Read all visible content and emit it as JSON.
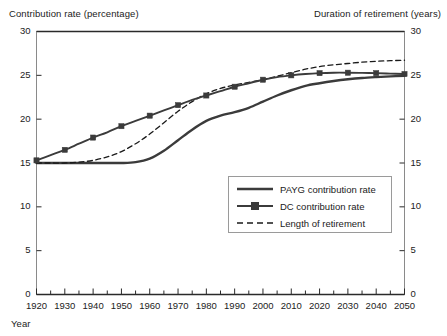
{
  "chart_data": {
    "type": "line",
    "title": "",
    "xlabel": "Year",
    "ylabel": "Contribution rate (percentage)",
    "y2label": "Duration of retirement (years)",
    "xlim": [
      1920,
      2050
    ],
    "ylim": [
      0,
      30
    ],
    "y2lim": [
      0,
      30
    ],
    "grid": false,
    "legend_position": "center-right-inside",
    "xticks": [
      1920,
      1930,
      1940,
      1950,
      1960,
      1970,
      1980,
      1990,
      2000,
      2010,
      2020,
      2030,
      2040,
      2050
    ],
    "xticks_minor": [
      1925,
      1935,
      1945,
      1955,
      1965,
      1975,
      1985,
      1995,
      2005,
      2015,
      2025,
      2035,
      2045
    ],
    "yticks": [
      0,
      5,
      10,
      15,
      20,
      25,
      30
    ],
    "y2ticks": [
      0,
      5,
      10,
      15,
      20,
      25,
      30
    ],
    "x": [
      1920,
      1925,
      1930,
      1935,
      1940,
      1945,
      1950,
      1955,
      1960,
      1965,
      1970,
      1975,
      1980,
      1985,
      1990,
      1995,
      2000,
      2005,
      2010,
      2015,
      2020,
      2025,
      2030,
      2035,
      2040,
      2045,
      2050
    ],
    "series": [
      {
        "name": "PAYG contribution rate",
        "style": "solid",
        "marker": "none",
        "color": "#3b3b3b",
        "width": 2.4,
        "axis": "left",
        "values": [
          15.0,
          15.0,
          15.0,
          15.0,
          15.0,
          15.0,
          15.0,
          15.1,
          15.5,
          16.4,
          17.6,
          18.8,
          19.8,
          20.4,
          20.8,
          21.3,
          22.0,
          22.7,
          23.3,
          23.8,
          24.1,
          24.35,
          24.55,
          24.7,
          24.8,
          24.88,
          24.95
        ]
      },
      {
        "name": "DC contribution rate",
        "style": "solid",
        "marker": "square",
        "color": "#3b3b3b",
        "width": 1.9,
        "axis": "left",
        "values": [
          15.3,
          15.9,
          16.5,
          17.2,
          17.9,
          18.5,
          19.2,
          19.8,
          20.4,
          21.0,
          21.6,
          22.2,
          22.7,
          23.2,
          23.7,
          24.1,
          24.5,
          24.8,
          25.0,
          25.15,
          25.25,
          25.3,
          25.3,
          25.28,
          25.25,
          25.2,
          25.15
        ]
      },
      {
        "name": "Length of retirement",
        "style": "dashed",
        "marker": "none",
        "color": "#1a1a1a",
        "width": 1.3,
        "axis": "right",
        "values": [
          15.0,
          15.0,
          15.0,
          15.1,
          15.3,
          15.7,
          16.3,
          17.2,
          18.3,
          19.6,
          20.9,
          22.0,
          22.9,
          23.5,
          23.9,
          24.2,
          24.5,
          24.9,
          25.3,
          25.7,
          26.0,
          26.2,
          26.35,
          26.5,
          26.6,
          26.67,
          26.72
        ]
      }
    ]
  },
  "legend": {
    "items": [
      {
        "label": "PAYG contribution rate",
        "swatch": "solid-thick-line"
      },
      {
        "label": "DC contribution rate",
        "swatch": "solid-line-with-square-marker"
      },
      {
        "label": "Length of retirement",
        "swatch": "dashed-line"
      }
    ]
  }
}
